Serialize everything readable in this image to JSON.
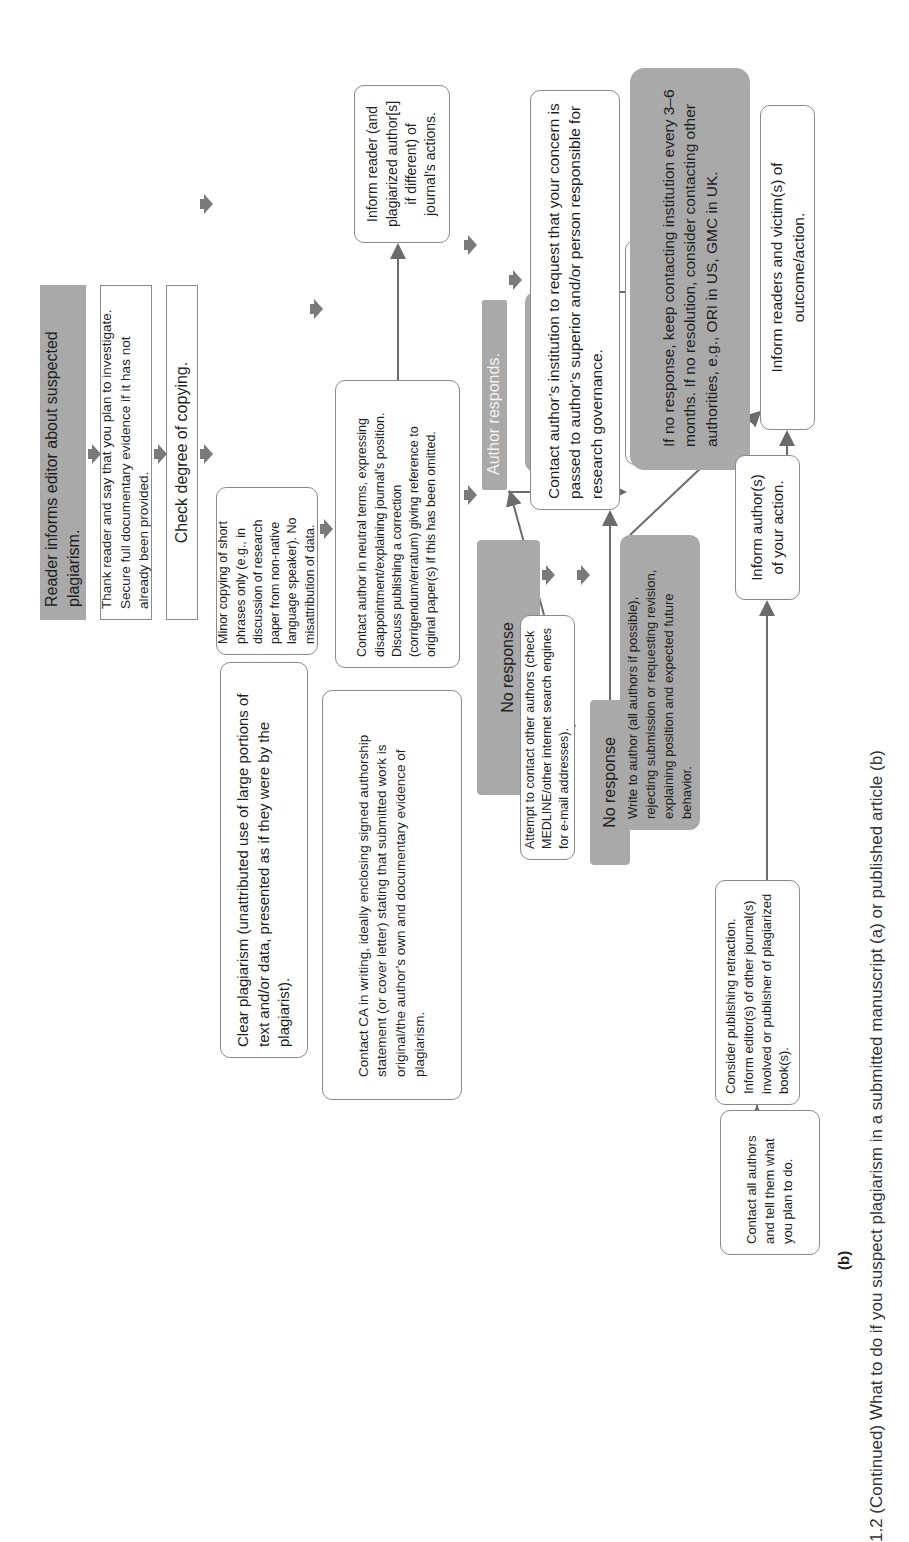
{
  "figure": {
    "panel_label": "(b)",
    "caption": "1.2 (Continued) What to do if you suspect plagiarism in a submitted manuscript (a) or published article (b)",
    "orientation": "rotated 90° counter-clockwise",
    "colors": {
      "gray_fill": "#a9a9a9",
      "border": "#8a8a8a",
      "arrow": "#6b6b6b"
    }
  },
  "nodes": {
    "reader_informs": "Reader informs editor about suspected plagiarism.",
    "thank_reader": "Thank reader and say that you plan to investigate. Secure full documentary evidence if it has not already been provided.",
    "check_degree": "Check degree of copying.",
    "minor_copying": "Minor copying of short phrases only (e.g., in discussion of research paper from non-native language speaker). No misattribution of data.",
    "contact_author_neutral": "Contact author in neutral terms, expressing disappointment/explaining journal’s position. Discuss publishing a correction (corrigendum/erratum) giving reference to original paper(s) if this has been omitted.",
    "inform_reader": "Inform reader (and plagiarized author[s] if different) of journal’s actions.",
    "clear_plagiarism": "Clear plagiarism (unattributed use of large portions of text and/or data, presented as if they were by the plagiarist).",
    "contact_ca": "Contact CA in writing, ideally enclosing signed authorship statement (or cover letter) stating that submitted work is original/the author’s own and documentary evidence of plagiarism.",
    "no_response_1": "No response",
    "author_responds": "Author responds.",
    "unsatisfactory": "Unsatisfactory explanation/ admits guilt",
    "attempt_contact": "Attempt to contact other authors (check MEDLINE/other internet search engines for e-mail addresses).",
    "no_response_2": "No response",
    "satisfactory": "Satisfactory explanation (honest error/journal instructions unclear/junior researcher).",
    "write_to_author": "Write to author (all authors if possible), rejecting submission or requesting revision, explaining position and expected future behavior.",
    "contact_institution": "Contact author’s institution to request that your concern is passed to author’s superior and/or person responsible for research governance.",
    "if_no_response": "If no response, keep contacting institution every 3–6 months. If no resolution, consider contacting other authorities, e.g., ORI in US, GMC in UK.",
    "inform_readers_victims": "Inform readers and victim(s) of outcome/action.",
    "consider_retraction": "Consider publishing retraction. Inform editor(s) of other journal(s) involved or publisher of plagiarized book(s).",
    "inform_authors_action": "Inform author(s) of your action.",
    "contact_all_authors": "Contact all authors and tell them what you plan to do."
  }
}
